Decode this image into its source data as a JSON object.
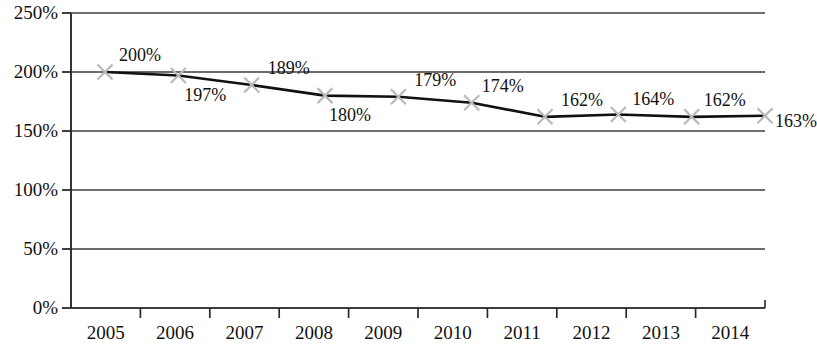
{
  "chart_data": {
    "type": "line",
    "title": "",
    "subtitle": "",
    "xlabel": "",
    "ylabel": "",
    "categories": [
      "2005",
      "2006",
      "2007",
      "2008",
      "2009",
      "2010",
      "2011",
      "2012",
      "2013",
      "2014"
    ],
    "values": [
      200,
      197,
      189,
      180,
      179,
      174,
      162,
      164,
      162,
      163
    ],
    "data_labels": [
      "200%",
      "197%",
      "189%",
      "180%",
      "179%",
      "174%",
      "162%",
      "164%",
      "162%",
      "163%"
    ],
    "series": [
      {
        "name": "",
        "values": [
          200,
          197,
          189,
          180,
          179,
          174,
          162,
          164,
          162,
          163
        ]
      }
    ],
    "ylim": [
      0,
      250
    ],
    "y_ticks": [
      0,
      50,
      100,
      150,
      200,
      250
    ],
    "y_tick_labels": [
      "0%",
      "50%",
      "100%",
      "150%",
      "200%",
      "250%"
    ],
    "x_tick_labels": [
      "2005",
      "2006",
      "2007",
      "2008",
      "2009",
      "2010",
      "2011",
      "2012",
      "2013",
      "2014"
    ],
    "grid": "horizontal",
    "legend": "none",
    "line_color": "#111111",
    "marker_color": "#b9b9b9",
    "marker_shape": "x",
    "gridline_color": "#3c3c3c",
    "axis_color": "#2a2a2a",
    "label_positions": [
      "above",
      "below",
      "above",
      "below",
      "above",
      "above",
      "above",
      "above",
      "above",
      "right"
    ]
  }
}
